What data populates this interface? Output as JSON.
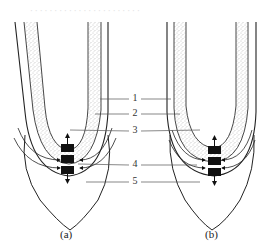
{
  "figure": {
    "panels": [
      {
        "id": "a",
        "caption": "(a)"
      },
      {
        "id": "b",
        "caption": "(b)"
      }
    ],
    "labels": [
      {
        "id": 1,
        "text": "1"
      },
      {
        "id": 2,
        "text": "2"
      },
      {
        "id": 3,
        "text": "3"
      },
      {
        "id": 4,
        "text": "4"
      },
      {
        "id": 5,
        "text": "5"
      }
    ],
    "colors": {
      "line": "#222222",
      "stipple": "#9a9a9a",
      "block": "#111111",
      "leader": "#555555",
      "background": "#ffffff"
    }
  }
}
